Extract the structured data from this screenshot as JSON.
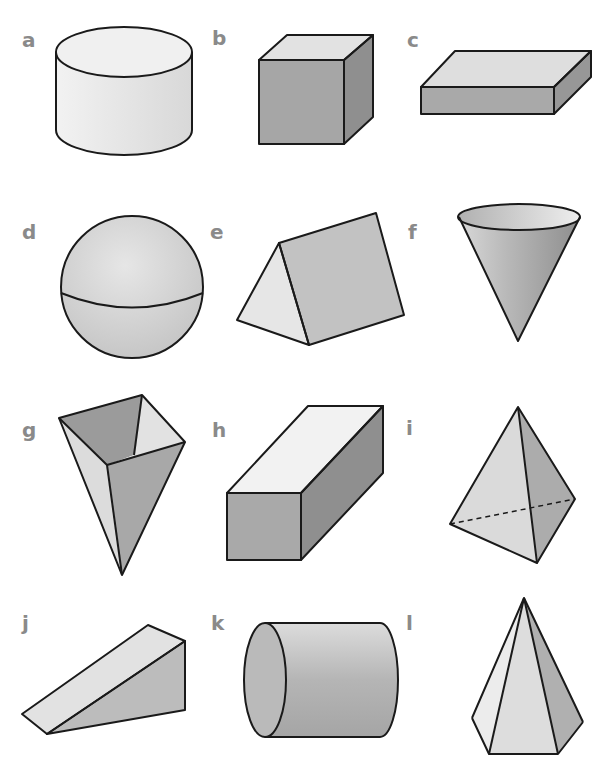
{
  "worksheet": {
    "type": "3D shapes identification sheet",
    "labels": {
      "a": "a",
      "b": "b",
      "c": "c",
      "d": "d",
      "e": "e",
      "f": "f",
      "g": "g",
      "h": "h",
      "i": "i",
      "j": "j",
      "k": "k",
      "l": "l"
    },
    "shapes": [
      {
        "label": "a",
        "shape": "cylinder (upright, short)"
      },
      {
        "label": "b",
        "shape": "cube"
      },
      {
        "label": "c",
        "shape": "cuboid (flat slab)"
      },
      {
        "label": "d",
        "shape": "sphere"
      },
      {
        "label": "e",
        "shape": "triangular prism"
      },
      {
        "label": "f",
        "shape": "cone (inverted)"
      },
      {
        "label": "g",
        "shape": "square-based pyramid (inverted, open)"
      },
      {
        "label": "h",
        "shape": "cuboid (long, square ends)"
      },
      {
        "label": "i",
        "shape": "triangular-based pyramid (tetrahedron)"
      },
      {
        "label": "j",
        "shape": "triangular prism (wedge)"
      },
      {
        "label": "k",
        "shape": "cylinder (on its side)"
      },
      {
        "label": "l",
        "shape": "hexagonal-based pyramid"
      }
    ],
    "colors": {
      "label": "#8a8a8a",
      "outline": "#1a1a1a",
      "light_face": "#ececec",
      "mid_face": "#bdbdbd",
      "dark_face": "#9e9e9e"
    }
  }
}
